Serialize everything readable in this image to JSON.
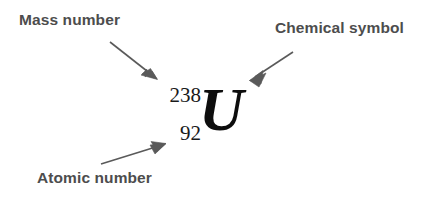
{
  "figure": {
    "background_color": "#ffffff",
    "label_color": "#4d4d4d",
    "symbol_color": "#0d0d0d",
    "arrow_color": "#5a5a5a",
    "width": 442,
    "height": 198
  },
  "labels": {
    "mass_number": "Mass number",
    "chemical_symbol": "Chemical symbol",
    "atomic_number": "Atomic number"
  },
  "nuclide": {
    "mass_number": "238",
    "atomic_number": "92",
    "symbol": "U"
  },
  "arrows": [
    {
      "name": "mass-number-arrow",
      "from_label": "Mass number",
      "points_to": "mass_number",
      "direction": "down-right"
    },
    {
      "name": "chemical-symbol-arrow",
      "from_label": "Chemical symbol",
      "points_to": "symbol",
      "direction": "down-left"
    },
    {
      "name": "atomic-number-arrow",
      "from_label": "Atomic number",
      "points_to": "atomic_number",
      "direction": "up-right"
    }
  ]
}
